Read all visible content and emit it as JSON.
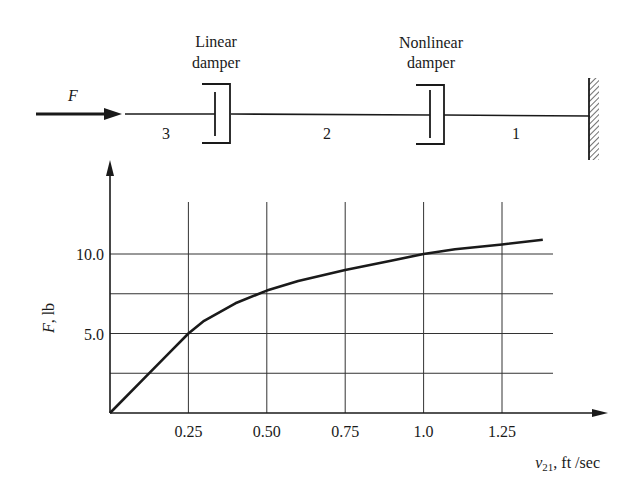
{
  "diagram": {
    "force_label": "F",
    "linear_damper_label_line1": "Linear",
    "linear_damper_label_line2": "damper",
    "nonlinear_damper_label_line1": "Nonlinear",
    "nonlinear_damper_label_line2": "damper",
    "node_labels": [
      "3",
      "2",
      "1"
    ]
  },
  "chart_data": {
    "type": "line",
    "title": "",
    "xlabel": "v21, ft /sec",
    "xlabel_parts": {
      "var": "v",
      "sub": "21",
      "unit": ", ft /sec"
    },
    "ylabel": "F, lb",
    "ylabel_parts": {
      "var": "F",
      "unit": ", lb"
    },
    "x_ticks": [
      "0.25",
      "0.50",
      "0.75",
      "1.0",
      "1.25"
    ],
    "y_ticks": [
      "5.0",
      "10.0"
    ],
    "x_grid": [
      0.25,
      0.5,
      0.75,
      1.0,
      1.25
    ],
    "y_grid": [
      2.5,
      5.0,
      7.5,
      10.0
    ],
    "xlim": [
      0,
      1.4
    ],
    "ylim": [
      0,
      13
    ],
    "grid": true,
    "series": [
      {
        "name": "F vs v21",
        "x": [
          0,
          0.1,
          0.2,
          0.25,
          0.3,
          0.4,
          0.5,
          0.6,
          0.75,
          0.9,
          1.0,
          1.1,
          1.25,
          1.38
        ],
        "y": [
          0,
          2.0,
          4.0,
          5.0,
          5.8,
          6.9,
          7.7,
          8.3,
          9.0,
          9.6,
          10.0,
          10.3,
          10.6,
          10.9
        ]
      }
    ]
  }
}
